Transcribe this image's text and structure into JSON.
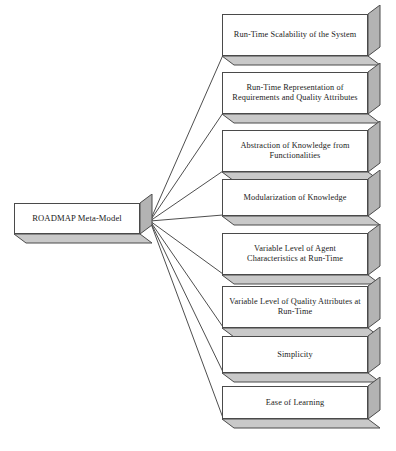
{
  "diagram": {
    "type": "fan-out-node-diagram",
    "colors": {
      "node_face": "#ffffff",
      "node_border": "#4a4a4a",
      "node_side": "#b3b3b3",
      "node_bottom": "#c9c9c9",
      "connector": "#3a3a3a",
      "text": "#1b1b1b",
      "background": "#ffffff"
    },
    "root": {
      "id": "roadmap-meta-model",
      "label": "ROADMAP Meta-Model",
      "x": 14,
      "y": 203,
      "w": 126,
      "h": 31
    },
    "connector_origin": {
      "x": 150,
      "y": 221
    },
    "leaves": [
      {
        "id": "run-time-scalability",
        "label": "Run-Time Scalability of the System",
        "x": 222,
        "y": 14,
        "w": 146,
        "h": 42
      },
      {
        "id": "run-time-representation",
        "label": "Run-Time Representation of Requirements and Quality Attributes",
        "x": 222,
        "y": 72,
        "w": 146,
        "h": 42
      },
      {
        "id": "abstraction-of-knowledge",
        "label": "Abstraction of Knowledge from Functionalities",
        "x": 222,
        "y": 130,
        "w": 146,
        "h": 42
      },
      {
        "id": "modularization-of-knowledge",
        "label": "Modularization of Knowledge",
        "x": 222,
        "y": 179,
        "w": 146,
        "h": 37
      },
      {
        "id": "variable-level-agent",
        "label": "Variable Level of Agent Characteristics at Run-Time",
        "x": 222,
        "y": 233,
        "w": 146,
        "h": 42
      },
      {
        "id": "variable-level-quality",
        "label": "Variable Level of Quality Attributes at Run-Time",
        "x": 222,
        "y": 286,
        "w": 146,
        "h": 42
      },
      {
        "id": "simplicity",
        "label": "Simplicity",
        "x": 222,
        "y": 336,
        "w": 146,
        "h": 37
      },
      {
        "id": "ease-of-learning",
        "label": "Ease of Learning",
        "x": 222,
        "y": 386,
        "w": 146,
        "h": 33
      }
    ],
    "depth": {
      "dx": 12,
      "dy": 9
    }
  }
}
